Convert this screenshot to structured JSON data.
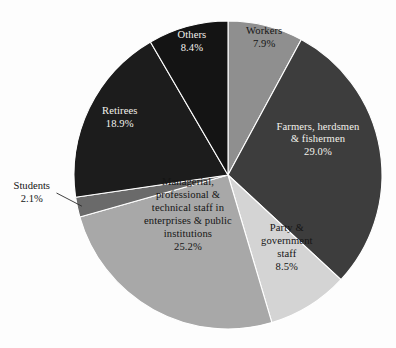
{
  "chart_data": {
    "type": "pie",
    "title": "",
    "subtitle": "",
    "xlabel": "",
    "ylabel": "",
    "legend_position": "none",
    "grid": false,
    "units": "percent",
    "start_angle_deg": 0,
    "direction": "clockwise",
    "total": 100.0,
    "categories": [
      "Workers",
      "Farmers, herdsmen\n& fishermen",
      "Party &\ngovernment\nstaff",
      "Managerial,\nprofessional &\ntechnical staff in\nenterprises & public\ninstitutions",
      "Students",
      "Retirees",
      "Others"
    ],
    "values": [
      7.9,
      29.0,
      8.5,
      25.2,
      2.1,
      18.9,
      8.4
    ],
    "value_labels": [
      "7.9%",
      "29.0%",
      "8.5%",
      "25.2%",
      "2.1%",
      "18.9%",
      "8.4%"
    ],
    "colors": [
      "#8f8f8f",
      "#3d3d3d",
      "#d4d4d4",
      "#a8a8a8",
      "#6a6a6a",
      "#1c1c1c",
      "#141414"
    ],
    "slices": [
      {
        "name": "Workers",
        "value": 7.9,
        "value_label": "7.9%",
        "color": "#8f8f8f",
        "text_color": "dark",
        "label_placement": "inside",
        "label_x": 264,
        "label_y": 38
      },
      {
        "name": "Farmers, herdsmen\n& fishermen",
        "value": 29.0,
        "value_label": "29.0%",
        "color": "#3d3d3d",
        "text_color": "light",
        "label_placement": "inside",
        "label_x": 318,
        "label_y": 140
      },
      {
        "name": "Party &\ngovernment\nstaff",
        "value": 8.5,
        "value_label": "8.5%",
        "color": "#d4d4d4",
        "text_color": "dark",
        "label_placement": "inside",
        "label_x": 287,
        "label_y": 248
      },
      {
        "name": "Managerial,\nprofessional &\ntechnical staff in\nenterprises & public\ninstitutions",
        "value": 25.2,
        "value_label": "25.2%",
        "color": "#a8a8a8",
        "text_color": "dark",
        "label_placement": "inside",
        "label_x": 188,
        "label_y": 215
      },
      {
        "name": "Students",
        "value": 2.1,
        "value_label": "2.1%",
        "color": "#6a6a6a",
        "text_color": "dark",
        "label_placement": "outside-left",
        "label_x": 32,
        "label_y": 193
      },
      {
        "name": "Retirees",
        "value": 18.9,
        "value_label": "18.9%",
        "color": "#1c1c1c",
        "text_color": "light",
        "label_placement": "inside",
        "label_x": 120,
        "label_y": 118
      },
      {
        "name": "Others",
        "value": 8.4,
        "value_label": "8.4%",
        "color": "#141414",
        "text_color": "light",
        "label_placement": "inside",
        "label_x": 192,
        "label_y": 42
      }
    ],
    "geometry": {
      "center_x": 228,
      "center_y": 175,
      "radius": 154
    },
    "background_color": "#fdfdfd"
  }
}
